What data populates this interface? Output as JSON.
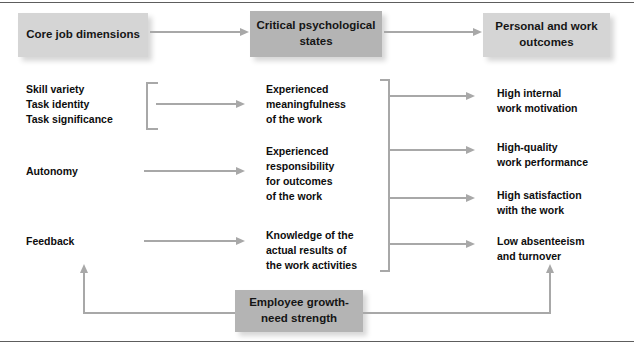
{
  "diagram": {
    "colors": {
      "box_light": "#d5d5d5",
      "box_dark": "#b4b4b4",
      "connector": "#a8a8a8",
      "frame": "#5d5d5d",
      "text": "#0d0d0d",
      "background": "#ffffff"
    }
  },
  "headers": {
    "core": "Core job\ndimensions",
    "states": "Critical\npsychological states",
    "outcomes": "Personal and\nwork outcomes"
  },
  "core_dimensions": {
    "group": "Skill variety\nTask identity\nTask significance",
    "autonomy": "Autonomy",
    "feedback": "Feedback"
  },
  "psychological_states": {
    "meaningfulness": "Experienced\nmeaningfulness\nof the work",
    "responsibility": "Experienced\nresponsibility\nfor outcomes\nof the work",
    "knowledge": "Knowledge of the\nactual results of\nthe work activities"
  },
  "outcomes": {
    "motivation": "High internal\nwork motivation",
    "performance": "High-quality\nwork performance",
    "satisfaction": "High satisfaction\nwith the work",
    "absenteeism": "Low absenteeism\nand turnover"
  },
  "moderator": {
    "growth_need": "Employee growth-\nneed strength"
  }
}
